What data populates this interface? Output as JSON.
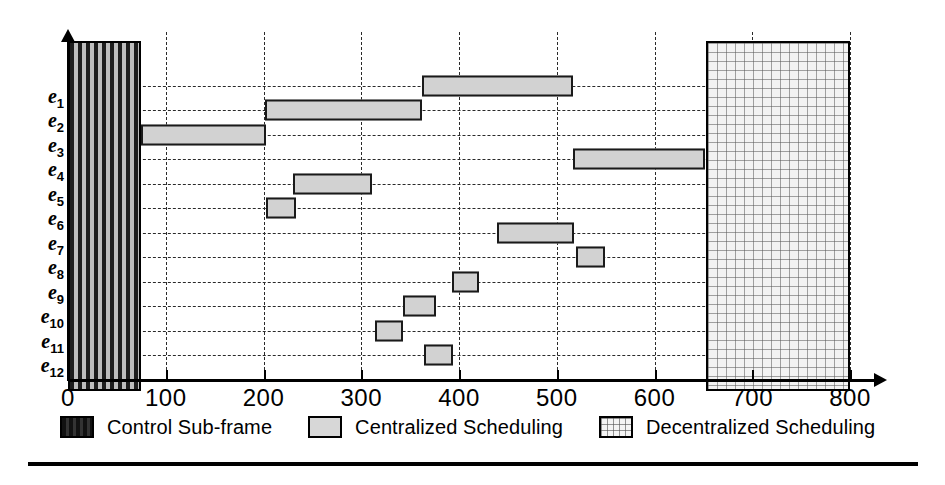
{
  "chart_data": {
    "type": "bar",
    "orientation": "horizontal",
    "subtype": "gantt",
    "title": "",
    "xlabel": "",
    "ylabel": "",
    "xlim": [
      0,
      820
    ],
    "ylim_categories": [
      "e1",
      "e2",
      "e3",
      "e4",
      "e5",
      "e6",
      "e7",
      "e8",
      "e9",
      "e10",
      "e11",
      "e12"
    ],
    "xticks": [
      0,
      100,
      200,
      300,
      400,
      500,
      600,
      700,
      800
    ],
    "xticklabels": [
      "0",
      "100",
      "200",
      "300",
      "400",
      "500",
      "600",
      "700",
      "800"
    ],
    "grid": "both-dashed",
    "legend_position": "bottom",
    "categories": [
      "e1",
      "e2",
      "e3",
      "e4",
      "e5",
      "e6",
      "e7",
      "e8",
      "e9",
      "e10",
      "e11",
      "e12"
    ],
    "tasks": [
      {
        "row": "e1",
        "start": 362,
        "end": 517,
        "duration": 155,
        "series": "Centralized Scheduling"
      },
      {
        "row": "e2",
        "start": 202,
        "end": 362,
        "duration": 160,
        "series": "Centralized Scheduling"
      },
      {
        "row": "e3",
        "start": 75,
        "end": 203,
        "duration": 128,
        "series": "Centralized Scheduling"
      },
      {
        "row": "e4",
        "start": 517,
        "end": 652,
        "duration": 135,
        "series": "Centralized Scheduling"
      },
      {
        "row": "e5",
        "start": 230,
        "end": 311,
        "duration": 81,
        "series": "Centralized Scheduling"
      },
      {
        "row": "e6",
        "start": 203,
        "end": 233,
        "duration": 30,
        "series": "Centralized Scheduling"
      },
      {
        "row": "e7",
        "start": 439,
        "end": 518,
        "duration": 79,
        "series": "Centralized Scheduling"
      },
      {
        "row": "e8",
        "start": 520,
        "end": 549,
        "duration": 29,
        "series": "Centralized Scheduling"
      },
      {
        "row": "e9",
        "start": 393,
        "end": 420,
        "duration": 27,
        "series": "Centralized Scheduling"
      },
      {
        "row": "e10",
        "start": 343,
        "end": 376,
        "duration": 33,
        "series": "Centralized Scheduling"
      },
      {
        "row": "e11",
        "start": 314,
        "end": 343,
        "duration": 29,
        "series": "Centralized Scheduling"
      },
      {
        "row": "e12",
        "start": 364,
        "end": 394,
        "duration": 30,
        "series": "Centralized Scheduling"
      }
    ],
    "regions": [
      {
        "name": "Control Sub-frame",
        "start": 0,
        "end": 75,
        "series": "Control Sub-frame"
      },
      {
        "name": "Decentralized Scheduling",
        "start": 653,
        "end": 800,
        "series": "Decentralized Scheduling"
      }
    ],
    "colors": {
      "control_sub_frame": "#1d1d1d",
      "centralized_scheduling": "#d2d2d2",
      "decentralized_scheduling": "#f2f2f2",
      "axis": "#000000",
      "grid": "#2a2a2a"
    }
  },
  "axis": {
    "x": {
      "ticks": [
        {
          "value": 0,
          "label": "0"
        },
        {
          "value": 100,
          "label": "100"
        },
        {
          "value": 200,
          "label": "200"
        },
        {
          "value": 300,
          "label": "300"
        },
        {
          "value": 400,
          "label": "400"
        },
        {
          "value": 500,
          "label": "500"
        },
        {
          "value": 600,
          "label": "600"
        },
        {
          "value": 700,
          "label": "700"
        },
        {
          "value": 800,
          "label": "800"
        }
      ]
    },
    "y": {
      "labels": [
        {
          "base": "e",
          "sub": "1"
        },
        {
          "base": "e",
          "sub": "2"
        },
        {
          "base": "e",
          "sub": "3"
        },
        {
          "base": "e",
          "sub": "4"
        },
        {
          "base": "e",
          "sub": "5"
        },
        {
          "base": "e",
          "sub": "6"
        },
        {
          "base": "e",
          "sub": "7"
        },
        {
          "base": "e",
          "sub": "8"
        },
        {
          "base": "e",
          "sub": "9"
        },
        {
          "base": "e",
          "sub": "10"
        },
        {
          "base": "e",
          "sub": "11"
        },
        {
          "base": "e",
          "sub": "12"
        }
      ]
    }
  },
  "legend": {
    "entries": [
      {
        "swatch": "control-subframe-swatch",
        "label": "Control Sub-frame"
      },
      {
        "swatch": "centralized-scheduling-swatch",
        "label": "Centralized Scheduling"
      },
      {
        "swatch": "decentralized-scheduling-swatch",
        "label": "Decentralized Scheduling"
      }
    ]
  }
}
